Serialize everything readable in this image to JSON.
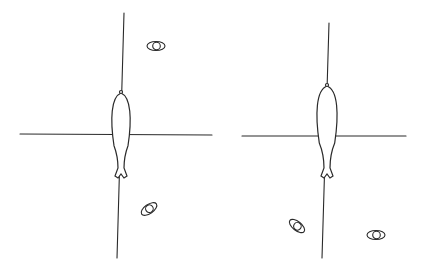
{
  "figure": {
    "panels": [
      {
        "id": "left",
        "vertical_axis": {
          "x1": 124,
          "y1": 13,
          "x2": 117,
          "y2": 258
        },
        "horizontal_axis": {
          "x1": 20,
          "y1": 134,
          "x2": 212,
          "y2": 135
        },
        "fish": {
          "cx": 121,
          "top": 93,
          "bottom": 178,
          "half_width": 10
        },
        "eye_markers": [
          {
            "cx": 156,
            "cy": 46,
            "rotate": 0
          },
          {
            "cx": 149,
            "cy": 209,
            "rotate": -35
          }
        ]
      },
      {
        "id": "right",
        "vertical_axis": {
          "x1": 329,
          "y1": 23,
          "x2": 322,
          "y2": 258
        },
        "horizontal_axis": {
          "x1": 242,
          "y1": 136,
          "x2": 406,
          "y2": 136
        },
        "fish": {
          "cx": 327,
          "top": 86,
          "bottom": 178,
          "half_width": 11
        },
        "eye_markers": [
          {
            "cx": 297,
            "cy": 226,
            "rotate": 38
          },
          {
            "cx": 376,
            "cy": 235,
            "rotate": 0
          }
        ]
      }
    ],
    "colors": {
      "stroke": "#2a2a2a",
      "background": "#ffffff"
    }
  }
}
